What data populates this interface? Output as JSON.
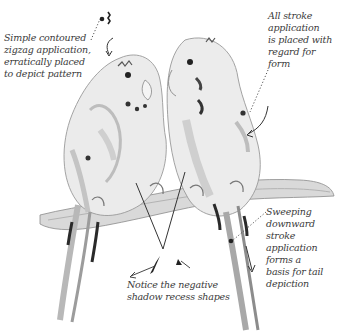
{
  "illustration": {
    "subject": "Two budgerigars perched side by side on a branch, pencil sketch",
    "colors": {
      "background": "#ffffff",
      "ink": "#3a3a3a",
      "shade_light": "#d8d8d8",
      "shade_mid": "#a9a9a9",
      "shade_dark": "#2a2a2a"
    }
  },
  "annotations": {
    "pattern_note": "Simple contoured\nzigzag application,\nerratically placed\nto depict pattern",
    "form_note": "All stroke\napplication\nis placed with\nregard for form",
    "tail_note": "Sweeping\ndownward\nstroke\napplication\nforms a\nbasis for tail\ndepiction",
    "shadow_note": "Notice the negative\nshadow recess shapes"
  }
}
